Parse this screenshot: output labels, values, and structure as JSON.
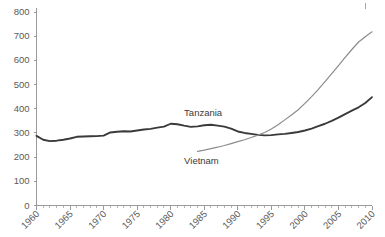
{
  "chart_data": {
    "type": "line",
    "title": "",
    "subtitle": "",
    "xlabel": "",
    "ylabel": "",
    "xlim": [
      1960,
      2010
    ],
    "ylim": [
      0,
      800
    ],
    "y_ticks": [
      0,
      100,
      200,
      300,
      400,
      500,
      600,
      700,
      800
    ],
    "x_ticks": [
      1960,
      1965,
      1970,
      1975,
      1980,
      1985,
      1990,
      1995,
      2000,
      2005,
      2010
    ],
    "x_minor_step": 1,
    "grid": false,
    "legend": "inline-labels",
    "x": [
      1960,
      1961,
      1962,
      1963,
      1964,
      1965,
      1966,
      1967,
      1968,
      1969,
      1970,
      1971,
      1972,
      1973,
      1974,
      1975,
      1976,
      1977,
      1978,
      1979,
      1980,
      1981,
      1982,
      1983,
      1984,
      1985,
      1986,
      1987,
      1988,
      1989,
      1990,
      1991,
      1992,
      1993,
      1994,
      1995,
      1996,
      1997,
      1998,
      1999,
      2000,
      2001,
      2002,
      2003,
      2004,
      2005,
      2006,
      2007,
      2008,
      2009,
      2010
    ],
    "series": [
      {
        "name": "Tanzania",
        "color": "#3a3a3a",
        "stroke_width": 1.9,
        "label_x": 1982,
        "label_y": 370,
        "start_year": 1960,
        "values": [
          288,
          272,
          266,
          268,
          272,
          277,
          284,
          285,
          286,
          287,
          289,
          302,
          305,
          307,
          306,
          310,
          314,
          317,
          322,
          326,
          338,
          336,
          330,
          325,
          327,
          332,
          334,
          330,
          326,
          318,
          306,
          300,
          296,
          292,
          290,
          291,
          294,
          296,
          300,
          304,
          310,
          318,
          328,
          338,
          350,
          363,
          378,
          392,
          406,
          424,
          448
        ]
      },
      {
        "name": "Vietnam",
        "color": "#8c8c8c",
        "stroke_width": 1.2,
        "label_x": 1982,
        "label_y": 170,
        "start_year": 1984,
        "values": [
          null,
          null,
          null,
          null,
          null,
          null,
          null,
          null,
          null,
          null,
          null,
          null,
          null,
          null,
          null,
          null,
          null,
          null,
          null,
          null,
          null,
          null,
          null,
          null,
          224,
          229,
          235,
          241,
          248,
          256,
          264,
          272,
          281,
          291,
          302,
          316,
          334,
          354,
          374,
          396,
          422,
          450,
          480,
          512,
          545,
          578,
          612,
          645,
          676,
          698,
          718
        ]
      }
    ]
  }
}
